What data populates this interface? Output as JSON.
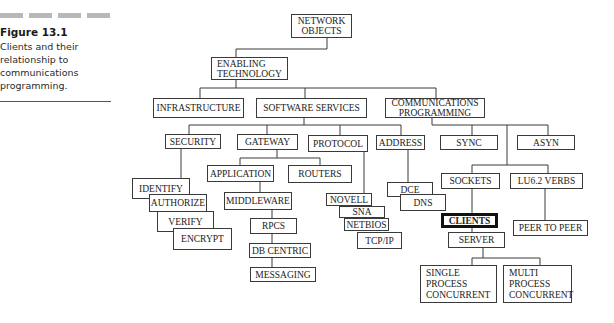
{
  "caption": {
    "figure_label": "Figure 13.1",
    "text": "Clients and their relationship to communications programming."
  },
  "nodes": {
    "network_objects": "NETWORK\nOBJECTS",
    "enabling_technology": "ENABLING\nTECHNOLOGY",
    "infrastructure": "INFRASTRUCTURE",
    "software_services": "SOFTWARE SERVICES",
    "communications_programming": "COMMUNICATIONS\nPROGRAMMING",
    "security": "SECURITY",
    "gateway": "GATEWAY",
    "protocol": "PROTOCOL",
    "address": "ADDRESS",
    "sync": "SYNC",
    "asyn": "ASYN",
    "identify": "IDENTIFY",
    "authorize": "AUTHORIZE",
    "verify": "VERIFY",
    "encrypt": "ENCRYPT",
    "application": "APPLICATION",
    "routers": "ROUTERS",
    "middleware": "MIDDLEWARE",
    "rpcs": "RPCS",
    "db_centric": "DB CENTRIC",
    "messaging": "MESSAGING",
    "novell": "NOVELL",
    "sna": "SNA",
    "netbios": "NETBIOS",
    "tcp_ip": "TCP/IP",
    "dce": "DCE",
    "dns": "DNS",
    "sockets": "SOCKETS",
    "lu62_verbs": "LU6.2 VERBS",
    "clients": "CLIENTS",
    "server": "SERVER",
    "peer_to_peer": "PEER TO PEER",
    "single_process_concurrent": "SINGLE\nPROCESS\nCONCURRENT",
    "multi_process_concurrent": "MULTI\nPROCESS\nCONCURRENT"
  },
  "colors": {
    "line": "#3a3a3a",
    "caption_dash": "#b8b8b8",
    "highlight_border": "#111111"
  }
}
